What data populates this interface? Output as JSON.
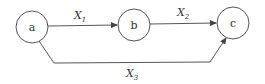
{
  "diagram": {
    "type": "directed-graph",
    "colors": {
      "stroke": "#555555",
      "text": "#333333",
      "background": "#ffffff"
    },
    "nodes": [
      {
        "id": "a",
        "label": "a",
        "cx": 32,
        "cy": 27,
        "r": 16
      },
      {
        "id": "b",
        "label": "b",
        "cx": 134,
        "cy": 25,
        "r": 16
      },
      {
        "id": "c",
        "label": "c",
        "cx": 233,
        "cy": 23,
        "r": 16
      }
    ],
    "edges": [
      {
        "id": "x1",
        "from": "a",
        "to": "b",
        "label": "X",
        "subscript": "1"
      },
      {
        "id": "x2",
        "from": "b",
        "to": "c",
        "label": "X",
        "subscript": "2"
      },
      {
        "id": "x3",
        "from": "a",
        "to": "c",
        "label": "X",
        "subscript": "3"
      }
    ]
  }
}
